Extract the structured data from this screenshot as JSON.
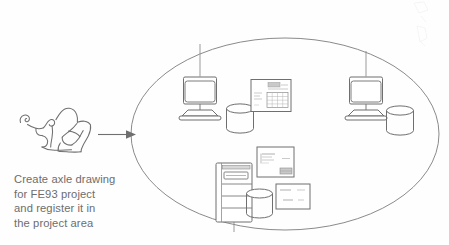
{
  "diagram": {
    "type": "network-concept-diagram",
    "title": "",
    "caption": {
      "text": "Create axle drawing\nfor FE93 project\nand register it in\nthe project area",
      "lines": [
        "Create axle drawing",
        "for FE93 project",
        "and register it in",
        "the project area"
      ]
    },
    "colors": {
      "stroke": "#6b6b6b",
      "stroke_light": "#8d8d8d",
      "stroke_faint": "#b4b4b4",
      "text": "#6d6d6d",
      "background": "#fefefe",
      "fill": "#ffffff"
    },
    "nodes": [
      {
        "id": "sketch",
        "label": "axle-drawing-sketch",
        "kind": "hand-drawn-sketch",
        "x": 18,
        "y": 108,
        "width": 78,
        "height": 55
      },
      {
        "id": "arrow",
        "label": "flow-arrow",
        "kind": "arrow",
        "from_x": 96,
        "to_x": 132,
        "y": 134
      },
      {
        "id": "network-boundary",
        "label": "project-area-network",
        "kind": "ellipse",
        "cx": 285,
        "cy": 134,
        "rx": 154,
        "ry": 96
      },
      {
        "id": "workstation-left",
        "label": "workstation",
        "kind": "crt-monitor",
        "x": 180,
        "y": 76
      },
      {
        "id": "workstation-right",
        "label": "workstation",
        "kind": "crt-monitor",
        "x": 340,
        "y": 76
      },
      {
        "id": "server-tower",
        "label": "server",
        "kind": "tower-computer",
        "x": 212,
        "y": 162
      },
      {
        "id": "disk-left",
        "label": "disk-storage",
        "kind": "cylinder",
        "x": 226,
        "y": 104
      },
      {
        "id": "disk-right",
        "label": "disk-storage",
        "kind": "cylinder",
        "x": 387,
        "y": 106
      },
      {
        "id": "disk-bottom",
        "label": "disk-storage",
        "kind": "cylinder",
        "x": 246,
        "y": 190
      },
      {
        "id": "document-top",
        "label": "drawing-document",
        "kind": "document-sheet",
        "x": 251,
        "y": 79,
        "width": 40,
        "height": 33
      },
      {
        "id": "document-mid",
        "label": "drawing-document",
        "kind": "document-sheet",
        "x": 256,
        "y": 146,
        "width": 37,
        "height": 31
      },
      {
        "id": "document-bottom",
        "label": "drawing-document",
        "kind": "document-sheet",
        "x": 275,
        "y": 183,
        "width": 34,
        "height": 26
      }
    ],
    "connections": [
      {
        "label": "uplink-left",
        "from": "workstation-left",
        "to": "network-boundary"
      },
      {
        "label": "uplink-right",
        "from": "workstation-right",
        "to": "network-boundary"
      },
      {
        "label": "downlink-server",
        "from": "server-tower",
        "to": "network-boundary"
      }
    ]
  }
}
